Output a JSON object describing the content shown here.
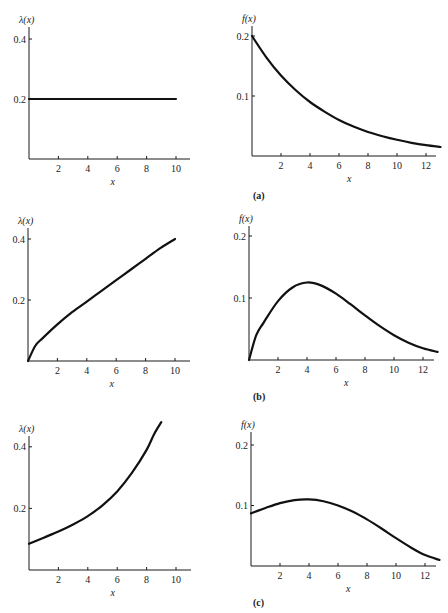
{
  "chart_data": [
    {
      "panel": "a",
      "side": "left",
      "type": "line",
      "ylabel": "λ(x)",
      "xlabel": "x",
      "xticks": [
        2,
        4,
        6,
        8,
        10
      ],
      "yticks": [
        "0.2",
        "0.4"
      ],
      "ytick_values": [
        0.2,
        0.4
      ],
      "xlim": [
        0,
        11
      ],
      "ylim": [
        0,
        0.44
      ],
      "x": [
        0,
        2,
        4,
        6,
        8,
        10
      ],
      "values": [
        0.2,
        0.2,
        0.2,
        0.2,
        0.2,
        0.2
      ]
    },
    {
      "panel": "a",
      "side": "right",
      "type": "line",
      "ylabel": "f(x)",
      "xlabel": "x",
      "caption": "(a)",
      "xticks": [
        2,
        4,
        6,
        8,
        10,
        12
      ],
      "yticks": [
        "0.1",
        "0.2"
      ],
      "ytick_values": [
        0.1,
        0.2
      ],
      "xlim": [
        0,
        13
      ],
      "ylim": [
        0,
        0.22
      ],
      "x": [
        0,
        1,
        2,
        3,
        4,
        5,
        6,
        7,
        8,
        9,
        10,
        11,
        12,
        13
      ],
      "values": [
        0.2,
        0.164,
        0.134,
        0.11,
        0.09,
        0.074,
        0.06,
        0.049,
        0.04,
        0.033,
        0.027,
        0.022,
        0.018,
        0.015
      ]
    },
    {
      "panel": "b",
      "side": "left",
      "type": "line",
      "ylabel": "λ(x)",
      "xlabel": "x",
      "xticks": [
        2,
        4,
        6,
        8,
        10
      ],
      "yticks": [
        "0.2",
        "0.4"
      ],
      "ytick_values": [
        0.2,
        0.4
      ],
      "xlim": [
        0,
        11
      ],
      "ylim": [
        0,
        0.44
      ],
      "x": [
        0,
        0.5,
        1,
        2,
        3,
        4,
        5,
        6,
        7,
        8,
        9,
        10
      ],
      "values": [
        0,
        0.05,
        0.075,
        0.12,
        0.16,
        0.195,
        0.23,
        0.265,
        0.3,
        0.335,
        0.37,
        0.4
      ]
    },
    {
      "panel": "b",
      "side": "right",
      "type": "line",
      "ylabel": "f(x)",
      "xlabel": "x",
      "caption": "(b)",
      "xticks": [
        2,
        4,
        6,
        8,
        10,
        12
      ],
      "yticks": [
        "0.1",
        "0.2"
      ],
      "ytick_values": [
        0.1,
        0.2
      ],
      "xlim": [
        0,
        13
      ],
      "ylim": [
        0,
        0.22
      ],
      "x": [
        0,
        0.5,
        1,
        2,
        3,
        4,
        5,
        6,
        7,
        8,
        9,
        10,
        11,
        12,
        13
      ],
      "values": [
        0,
        0.04,
        0.06,
        0.095,
        0.117,
        0.125,
        0.12,
        0.107,
        0.09,
        0.072,
        0.055,
        0.04,
        0.028,
        0.019,
        0.013
      ]
    },
    {
      "panel": "c",
      "side": "left",
      "type": "line",
      "ylabel": "λ(x)",
      "xlabel": "x",
      "xticks": [
        2,
        4,
        6,
        8,
        10
      ],
      "yticks": [
        "0.2",
        "0.4"
      ],
      "ytick_values": [
        0.2,
        0.4
      ],
      "xlim": [
        0,
        11
      ],
      "ylim": [
        0,
        0.44
      ],
      "x": [
        0,
        1,
        2,
        3,
        4,
        5,
        6,
        7,
        8,
        8.5,
        9
      ],
      "values": [
        0.085,
        0.105,
        0.125,
        0.148,
        0.175,
        0.21,
        0.255,
        0.315,
        0.39,
        0.44,
        0.48
      ]
    },
    {
      "panel": "c",
      "side": "right",
      "type": "line",
      "ylabel": "f(x)",
      "xlabel": "x",
      "caption": "(c)",
      "xticks": [
        2,
        4,
        6,
        8,
        10,
        12
      ],
      "yticks": [
        "0.1",
        "0.2"
      ],
      "ytick_values": [
        0.1,
        0.2
      ],
      "xlim": [
        0,
        13
      ],
      "ylim": [
        0,
        0.22
      ],
      "x": [
        0,
        1,
        2,
        3,
        4,
        5,
        6,
        7,
        8,
        9,
        10,
        11,
        12,
        13
      ],
      "values": [
        0.087,
        0.096,
        0.104,
        0.109,
        0.11,
        0.107,
        0.1,
        0.09,
        0.077,
        0.062,
        0.046,
        0.031,
        0.018,
        0.01
      ]
    }
  ],
  "layout": [
    {
      "ox": 29,
      "oy": 159,
      "xscale": 14.7,
      "yscale": 300,
      "axis_x_end": 190,
      "axis_y_top": 27
    },
    {
      "ox": 252,
      "oy": 156,
      "xscale": 14.5,
      "yscale": 600,
      "axis_x_end": 436,
      "axis_y_top": 26
    },
    {
      "ox": 28,
      "oy": 361,
      "xscale": 14.7,
      "yscale": 305,
      "axis_x_end": 190,
      "axis_y_top": 228
    },
    {
      "ox": 249,
      "oy": 360,
      "xscale": 14.5,
      "yscale": 620,
      "axis_x_end": 434,
      "axis_y_top": 226
    },
    {
      "ox": 29,
      "oy": 570,
      "xscale": 14.7,
      "yscale": 308,
      "axis_x_end": 191,
      "axis_y_top": 436
    },
    {
      "ox": 251,
      "oy": 566,
      "xscale": 14.5,
      "yscale": 605,
      "axis_x_end": 436,
      "axis_y_top": 432
    }
  ],
  "captions": [
    {
      "text": "(a)",
      "x": 253,
      "y": 199
    },
    {
      "text": "(b)",
      "x": 253,
      "y": 400
    },
    {
      "text": "(c)",
      "x": 253,
      "y": 606
    }
  ]
}
